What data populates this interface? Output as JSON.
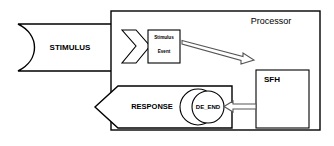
{
  "diagram": {
    "colors": {
      "stroke": "#000000",
      "fill": "#ffffff",
      "arrow_stroke": "#555555"
    },
    "nodes": {
      "stimulus_banner": {
        "label": "STIMULUS",
        "shape": "concave-left-banner"
      },
      "processor_box": {
        "label": "Processor",
        "shape": "rectangle"
      },
      "stimulus_event_box": {
        "line1": "Stimulus",
        "line2": "Event",
        "shape": "rectangle"
      },
      "chevron": {
        "label": "",
        "shape": "chevron-right"
      },
      "sfh_box": {
        "label": "SFH",
        "shape": "rectangle"
      },
      "de_end_circle": {
        "label": "DE_END",
        "shape": "circle"
      },
      "de_end_outer_circle": {
        "label": "",
        "shape": "circle"
      },
      "response_banner": {
        "label": "RESPONSE",
        "shape": "left-arrow-banner"
      }
    },
    "arrows": {
      "event_to_sfh": {
        "label": "",
        "direction": "down-right",
        "style": "hollow-open"
      },
      "sfh_to_de_end": {
        "label": "",
        "direction": "left",
        "style": "hollow-open"
      }
    }
  }
}
